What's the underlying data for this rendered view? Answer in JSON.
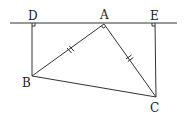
{
  "diagram": {
    "type": "geometry",
    "points": {
      "D": {
        "label": "D",
        "x": 32,
        "y": 23
      },
      "A": {
        "label": "A",
        "x": 104,
        "y": 24
      },
      "E": {
        "label": "E",
        "x": 154,
        "y": 23
      },
      "B": {
        "label": "B",
        "x": 32,
        "y": 76
      },
      "C": {
        "label": "C",
        "x": 156,
        "y": 97
      }
    },
    "line": {
      "x1": 10,
      "y1": 23,
      "x2": 177,
      "y2": 23
    },
    "segments": [
      {
        "from": "D",
        "to": "B"
      },
      {
        "from": "E",
        "to": "C"
      },
      {
        "from": "A",
        "to": "B",
        "tick_marks": 2
      },
      {
        "from": "A",
        "to": "C",
        "tick_marks": 2
      },
      {
        "from": "B",
        "to": "C"
      }
    ],
    "right_angles": [
      "D",
      "E",
      "A"
    ],
    "stroke_color": "#333333"
  }
}
